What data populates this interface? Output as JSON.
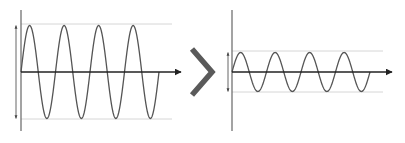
{
  "diagram": {
    "colors": {
      "wave": "#555555",
      "axis": "#333333",
      "guide": "#d6d6d6",
      "chevron": "#5a5a5a",
      "background": "#ffffff"
    },
    "left_panel": {
      "name": "high-amplitude-wave",
      "cycles": 4,
      "amplitude_px": 46.5,
      "origin": [
        21,
        72
      ],
      "axis_x_end": 181,
      "axis_y_range": [
        10,
        131
      ],
      "wave_x_end": 159,
      "guide_top": 24,
      "guide_bottom": 119,
      "guide_x_end": 172,
      "arrow_x": 16
    },
    "transition": {
      "icon": "chevron-right-icon"
    },
    "right_panel": {
      "name": "low-amplitude-wave",
      "cycles": 4,
      "amplitude_px": 19.5,
      "origin": [
        232,
        72
      ],
      "axis_x_end": 392,
      "axis_y_range": [
        10,
        131
      ],
      "wave_x_end": 370,
      "guide_top": 51,
      "guide_bottom": 92,
      "guide_x_end": 383,
      "arrow_x": 228
    }
  }
}
